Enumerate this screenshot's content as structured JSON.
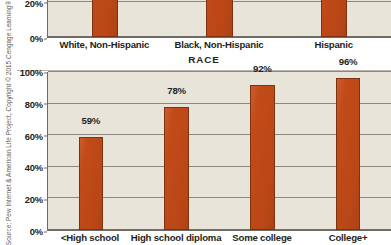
{
  "source_note": "Source: Pew Internet & American Life Project, Copyright © 2015 Cengage Learning®",
  "colors": {
    "bar": "#C24A18",
    "bar_border": "#7D3210",
    "plot_background": "#E9E4DA",
    "axis": "#6F6B66",
    "gridline": "#8C8780",
    "text": "#231F20",
    "page_background": "#FFFFFF"
  },
  "chart_data": [
    {
      "id": "race",
      "type": "bar",
      "title": "",
      "xlabel": "RACE",
      "ylabel": "",
      "categories": [
        "White, Non-Hispanic",
        "Black, Non-Hispanic",
        "Hispanic"
      ],
      "values": [
        84,
        78,
        81
      ],
      "value_labels": [
        "",
        "",
        ""
      ],
      "ylim": [
        0,
        100
      ],
      "yticks": [
        0,
        20,
        40,
        60,
        80,
        100
      ],
      "ytick_labels": [
        "0%",
        "20%",
        "40%",
        "60%",
        "80%",
        "100%"
      ],
      "visible_ytick_labels": [
        "0%",
        "20%"
      ],
      "grid": true,
      "legend": "none",
      "note": "top chart is cropped by the image edge; only the 0% and 20% tick labels are visible"
    },
    {
      "id": "education",
      "type": "bar",
      "title": "",
      "xlabel": "",
      "ylabel": "",
      "categories": [
        "<High school",
        "High school diploma",
        "Some college",
        "College+"
      ],
      "values": [
        59,
        78,
        92,
        96
      ],
      "value_labels": [
        "59%",
        "78%",
        "92%",
        "96%"
      ],
      "ylim": [
        0,
        100
      ],
      "yticks": [
        0,
        20,
        40,
        60,
        80,
        100
      ],
      "ytick_labels": [
        "0%",
        "20%",
        "40%",
        "60%",
        "80%",
        "100%"
      ],
      "grid": true,
      "legend": "none"
    }
  ]
}
